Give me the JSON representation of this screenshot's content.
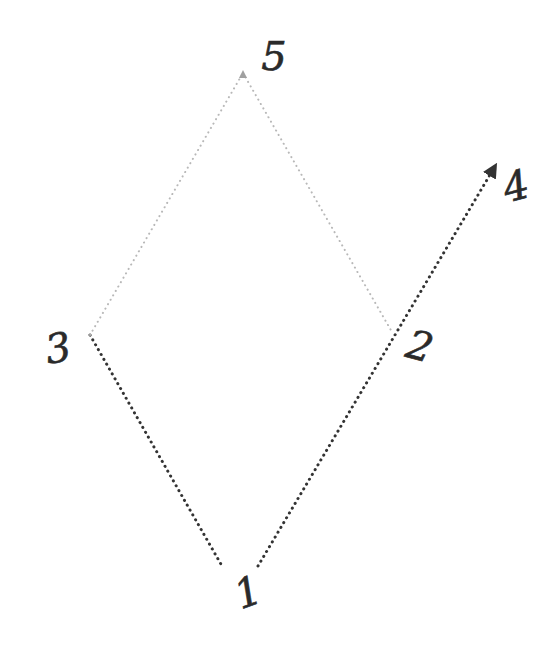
{
  "diagram": {
    "type": "hand-drawn path diagram",
    "background": "#ffffff",
    "colors": {
      "dark_dotted": "#333333",
      "light_dotted": "#b8b8b8",
      "label": "#2a2a2a"
    },
    "points": [
      {
        "id": "1",
        "label": "1",
        "x": 240,
        "y": 566,
        "label_x": 248,
        "label_y": 606,
        "rotate": -20
      },
      {
        "id": "2",
        "label": "2",
        "x": 392,
        "y": 332,
        "label_x": 420,
        "label_y": 360,
        "rotate": 15
      },
      {
        "id": "3",
        "label": "3",
        "x": 90,
        "y": 335,
        "label_x": 58,
        "label_y": 362,
        "rotate": -10
      },
      {
        "id": "4",
        "label": "4",
        "x": 498,
        "y": 163,
        "label_x": 516,
        "label_y": 200,
        "rotate": -15
      },
      {
        "id": "5",
        "label": "5",
        "x": 243,
        "y": 73,
        "label_x": 274,
        "label_y": 70,
        "rotate": 0
      }
    ],
    "segments": [
      {
        "from": "3",
        "to": "1",
        "style": "dark_dotted",
        "x1": 90,
        "y1": 335,
        "x2": 222,
        "y2": 566
      },
      {
        "from": "1",
        "to": "4",
        "style": "dark_dotted",
        "x1": 258,
        "y1": 566,
        "x2": 494,
        "y2": 168,
        "arrow": true
      },
      {
        "from": "3",
        "to": "5",
        "style": "light_dotted",
        "x1": 90,
        "y1": 335,
        "x2": 243,
        "y2": 73
      },
      {
        "from": "5",
        "to": "2",
        "style": "light_dotted",
        "x1": 243,
        "y1": 73,
        "x2": 392,
        "y2": 332
      }
    ]
  }
}
